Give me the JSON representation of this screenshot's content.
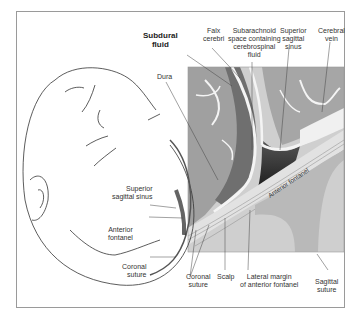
{
  "figure": {
    "colors": {
      "panel_bg": "#c9c9c9",
      "brain": "#9c9c9c",
      "subdural": "#6e6e6e",
      "sinus": "#3a3a3a",
      "membrane": "#f2f2f2",
      "fontanel": "#bdbdbd",
      "line": "#444444"
    },
    "labels": {
      "subdural_fluid": [
        "Subdural",
        "fluid"
      ],
      "falx_cerebri": [
        "Falx",
        "cerebri"
      ],
      "subarachnoid_space": [
        "Subarachnoid",
        "space containing",
        "cerebrospinal",
        "fluid"
      ],
      "superior_sagittal_sinus_top": [
        "Superior",
        "sagittal",
        "sinus"
      ],
      "cerebral_vein": [
        "Cerebral",
        "vein"
      ],
      "dura": [
        "Dura"
      ],
      "anterior_fontanel_panel": "Anterior fontanel",
      "superior_sagittal_sinus_head": [
        "Superior",
        "sagittal sinus"
      ],
      "anterior_fontanel_head": [
        "Anterior",
        "fontanel"
      ],
      "coronal_suture_head": [
        "Coronal",
        "suture"
      ],
      "coronal_suture_bottom": [
        "Coronal",
        "suture"
      ],
      "scalp": [
        "Scalp"
      ],
      "lateral_margin": [
        "Lateral margin",
        "of anterior fontanel"
      ],
      "sagittal_suture": [
        "Sagittal",
        "suture"
      ]
    }
  }
}
